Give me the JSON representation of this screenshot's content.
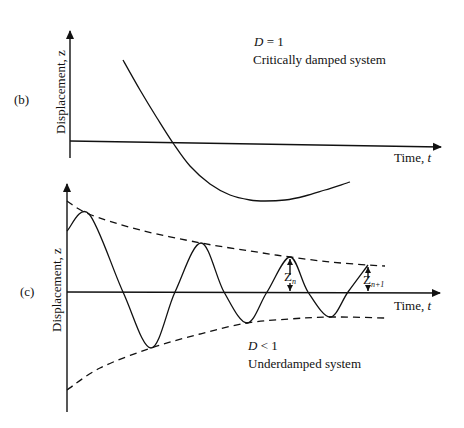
{
  "chart_data": [
    {
      "panel": "(b)",
      "type": "line",
      "title": "Critically damped system",
      "annotation": "D = 1",
      "xlabel": "Time, t",
      "ylabel": "Displacement, z",
      "grid": false,
      "series": [
        {
          "name": "critically damped response",
          "style": "solid",
          "points_px": [
            [
              123,
              60
            ],
            [
              140,
              90
            ],
            [
              157,
              118
            ],
            [
              173,
              143
            ],
            [
              190,
              166
            ],
            [
              210,
              184
            ],
            [
              230,
              195
            ],
            [
              250,
              200
            ],
            [
              265,
              201
            ],
            [
              285,
              200
            ],
            [
              305,
              196
            ],
            [
              325,
              190
            ],
            [
              350,
              182
            ]
          ]
        }
      ],
      "axes_px": {
        "y_axis": [
          [
            70,
            30
          ],
          [
            70,
            158
          ]
        ],
        "x_axis": [
          [
            70,
            141
          ],
          [
            441,
            147
          ]
        ]
      }
    },
    {
      "panel": "(c)",
      "type": "line",
      "title": "Underdamped system",
      "annotation": "D < 1",
      "xlabel": "Time, t",
      "ylabel": "Displacement, z",
      "grid": false,
      "series": [
        {
          "name": "underdamped response",
          "style": "solid",
          "points_px": [
            [
              67,
              231
            ],
            [
              89,
              214
            ],
            [
              123,
              292
            ],
            [
              151,
              348
            ],
            [
              175,
              292
            ],
            [
              201,
              243
            ],
            [
              224,
              292
            ],
            [
              247,
              323
            ],
            [
              267,
              292
            ],
            [
              290,
              257
            ],
            [
              308,
              292
            ],
            [
              330,
              317
            ],
            [
              348,
              292
            ],
            [
              368,
              265
            ]
          ]
        },
        {
          "name": "upper envelope",
          "style": "dashed",
          "points_px": [
            [
              67,
              201
            ],
            [
              89,
              214
            ],
            [
              140,
              230
            ],
            [
              201,
              243
            ],
            [
              250,
              251
            ],
            [
              290,
              257
            ],
            [
              330,
              262
            ],
            [
              368,
              265
            ],
            [
              385,
              266
            ]
          ]
        },
        {
          "name": "lower envelope",
          "style": "dashed",
          "points_px": [
            [
              67,
              390
            ],
            [
              100,
              368
            ],
            [
              151,
              348
            ],
            [
              200,
              334
            ],
            [
              247,
              323
            ],
            [
              290,
              319
            ],
            [
              330,
              317
            ],
            [
              385,
              318
            ]
          ]
        }
      ],
      "markers": [
        {
          "label": "Z",
          "subscript": "n",
          "x_px": 290,
          "from_y": 257,
          "to_y": 292
        },
        {
          "label": "Z",
          "subscript": "n+1",
          "x_px": 368,
          "from_y": 265,
          "to_y": 292
        }
      ],
      "axes_px": {
        "y_axis": [
          [
            67,
            183
          ],
          [
            67,
            412
          ]
        ],
        "x_axis": [
          [
            67,
            292
          ],
          [
            440,
            293
          ]
        ]
      }
    }
  ],
  "labels": {
    "panel_b": "(b)",
    "panel_c": "(c)",
    "b_ylabel": "Displacement, z",
    "c_ylabel": "Displacement, z",
    "b_xlabel_text": "Time, ",
    "b_xlabel_var": "t",
    "c_xlabel_text": "Time, ",
    "c_xlabel_var": "t",
    "b_damping_var": "D",
    "b_damping_rest": " = 1",
    "b_system": "Critically damped system",
    "c_damping_var": "D",
    "c_damping_rest": " < 1",
    "c_system": "Underdamped system",
    "zn_main": "Z",
    "zn_sub": "n",
    "zn1_main": "Z",
    "zn1_sub": "n+1"
  }
}
